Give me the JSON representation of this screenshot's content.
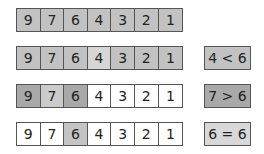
{
  "colors": {
    "gray": "#c2c2c2",
    "light": "#d6d6d6",
    "dark": "#a9a9a9",
    "mid": "#cbcbcb",
    "white": "#ffffff"
  },
  "rows": [
    {
      "cells": [
        {
          "value": "9",
          "fill": "#c2c2c2"
        },
        {
          "value": "7",
          "fill": "#c2c2c2"
        },
        {
          "value": "6",
          "fill": "#c2c2c2"
        },
        {
          "value": "4",
          "fill": "#c2c2c2"
        },
        {
          "value": "3",
          "fill": "#c2c2c2"
        },
        {
          "value": "2",
          "fill": "#c2c2c2"
        },
        {
          "value": "1",
          "fill": "#c2c2c2"
        }
      ],
      "comparison": null
    },
    {
      "cells": [
        {
          "value": "9",
          "fill": "#c2c2c2"
        },
        {
          "value": "7",
          "fill": "#c2c2c2"
        },
        {
          "value": "6",
          "fill": "#c2c2c2"
        },
        {
          "value": "4",
          "fill": "#d6d6d6"
        },
        {
          "value": "3",
          "fill": "#c2c2c2"
        },
        {
          "value": "2",
          "fill": "#c2c2c2"
        },
        {
          "value": "1",
          "fill": "#c2c2c2"
        }
      ],
      "comparison": {
        "label": "4 < 6",
        "fill": "#c2c2c2"
      }
    },
    {
      "cells": [
        {
          "value": "9",
          "fill": "#a9a9a9"
        },
        {
          "value": "7",
          "fill": "#cbcbcb"
        },
        {
          "value": "6",
          "fill": "#a9a9a9"
        },
        {
          "value": "4",
          "fill": "#ffffff"
        },
        {
          "value": "3",
          "fill": "#ffffff"
        },
        {
          "value": "2",
          "fill": "#ffffff"
        },
        {
          "value": "1",
          "fill": "#ffffff"
        }
      ],
      "comparison": {
        "label": "7 > 6",
        "fill": "#a9a9a9"
      }
    },
    {
      "cells": [
        {
          "value": "9",
          "fill": "#ffffff"
        },
        {
          "value": "7",
          "fill": "#ffffff"
        },
        {
          "value": "6",
          "fill": "#c4c4c4"
        },
        {
          "value": "4",
          "fill": "#ffffff"
        },
        {
          "value": "3",
          "fill": "#ffffff"
        },
        {
          "value": "2",
          "fill": "#ffffff"
        },
        {
          "value": "1",
          "fill": "#ffffff"
        }
      ],
      "comparison": {
        "label": "6 = 6",
        "fill": "#d8d8d8"
      }
    }
  ]
}
